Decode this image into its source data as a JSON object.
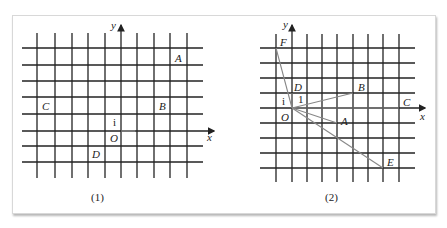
{
  "figure1": {
    "caption": "(1)",
    "axis_x": "x",
    "axis_y": "y",
    "unit_label": "i",
    "origin_label": "O",
    "points": [
      {
        "label": "A",
        "x": 3,
        "y": 4
      },
      {
        "label": "B",
        "x": 2,
        "y": 1
      },
      {
        "label": "C",
        "x": -5,
        "y": 1
      },
      {
        "label": "D",
        "x": -1,
        "y": -1
      }
    ]
  },
  "figure2": {
    "caption": "(2)",
    "axis_x": "x",
    "axis_y": "y",
    "unit_label_x": "i",
    "unit_label_y": "1",
    "origin_label": "O",
    "points": [
      {
        "label": "A",
        "x": 3,
        "y": -1
      },
      {
        "label": "B",
        "x": 4,
        "y": 1
      },
      {
        "label": "C",
        "x": 7,
        "y": 0
      },
      {
        "label": "D",
        "x": 0,
        "y": 1
      },
      {
        "label": "E",
        "x": 6,
        "y": -4
      },
      {
        "label": "F",
        "x": -1,
        "y": 4
      }
    ]
  },
  "colors": {
    "grid": "#222222",
    "vector": "#888888"
  }
}
